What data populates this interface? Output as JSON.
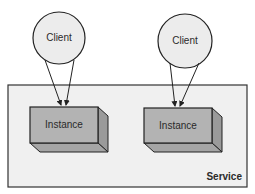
{
  "diagram": {
    "service": {
      "label": "Service",
      "fill": "#f0f0f0",
      "stroke": "#333333"
    },
    "clients": [
      {
        "label": "Client",
        "fill": "#ececec"
      },
      {
        "label": "Client",
        "fill": "#ececec"
      }
    ],
    "instances": [
      {
        "label": "Instance",
        "front_fill": "#b3b3b3",
        "side_fill": "#9a9a9a"
      },
      {
        "label": "Instance",
        "front_fill": "#b3b3b3",
        "side_fill": "#9a9a9a"
      }
    ]
  }
}
